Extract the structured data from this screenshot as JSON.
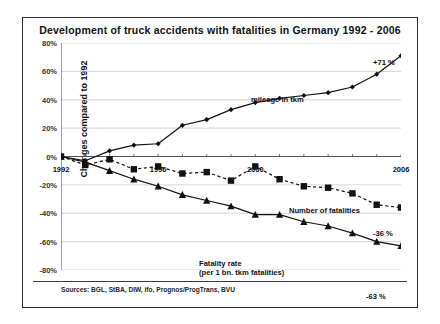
{
  "chart_data": {
    "type": "line",
    "title": "Development of truck accidents with fatalities in Germany 1992 - 2006",
    "xlabel": "",
    "ylabel": "Changes compared to 1992",
    "ylim": [
      -80,
      80
    ],
    "ytick_labels": [
      "80%",
      "60%",
      "40%",
      "20%",
      "0%",
      "-20%",
      "-40%",
      "-60%",
      "-80%"
    ],
    "ytick_values": [
      80,
      60,
      40,
      20,
      0,
      -20,
      -40,
      -60,
      -80
    ],
    "grid": true,
    "legend_position": "inline-annotations",
    "x": [
      1992,
      1993,
      1994,
      1995,
      1996,
      1997,
      1998,
      1999,
      2000,
      2001,
      2002,
      2003,
      2004,
      2005,
      2006
    ],
    "xtick_labels": [
      "1992",
      "1996",
      "2000",
      "2006"
    ],
    "xtick_label_values": [
      1992,
      1996,
      2000,
      2006
    ],
    "series": [
      {
        "name": "mileage in tkm",
        "marker": "diamond",
        "line_style": "solid",
        "values": [
          0,
          -3,
          4,
          8,
          9,
          22,
          26,
          33,
          38,
          41,
          43,
          45,
          49,
          58,
          71
        ]
      },
      {
        "name": "Number of fatalities",
        "marker": "square",
        "line_style": "dashed",
        "values": [
          0,
          -6,
          -2,
          -9,
          -7,
          -12,
          -11,
          -17,
          -7,
          -16,
          -21,
          -22,
          -26,
          -34,
          -36
        ]
      },
      {
        "name": "Fatality rate (per 1 bn. tkm fatalities)",
        "marker": "triangle",
        "line_style": "solid",
        "values": [
          0,
          -4,
          -10,
          -16,
          -21,
          -27,
          -31,
          -35,
          -41,
          -41,
          -46,
          -49,
          -54,
          -60,
          -63
        ]
      }
    ],
    "annotations": [
      {
        "text": "mileage in tkm",
        "x_px": 190,
        "y_px": 52
      },
      {
        "text": "Number of fatalities",
        "x_px": 228,
        "y_px": 163
      },
      {
        "text": "Fatality rate",
        "x_px": 138,
        "y_px": 216
      },
      {
        "text": "(per 1 bn. tkm fatalities)",
        "x_px": 138,
        "y_px": 225
      }
    ],
    "endpoint_labels": [
      {
        "text": "+71 %",
        "series": "mileage in tkm",
        "x_px": 312,
        "y_px": 15
      },
      {
        "text": "-36 %",
        "series": "Number of fatalities",
        "x_px": 312,
        "y_px": 186
      },
      {
        "text": "-63 %",
        "series": "Fatality rate (per 1 bn. tkm fatalities)",
        "x_px": 305,
        "y_px": 249
      }
    ],
    "source": "Sources: BGL, StBA, DIW, ifo, Prognos/ProgTrans, BVU"
  },
  "colors": {
    "line": "#111111",
    "grid": "#c9c9c9",
    "axis": "#555555",
    "frame": "#2b2b2b",
    "text": "#111111",
    "background": "#ffffff"
  }
}
